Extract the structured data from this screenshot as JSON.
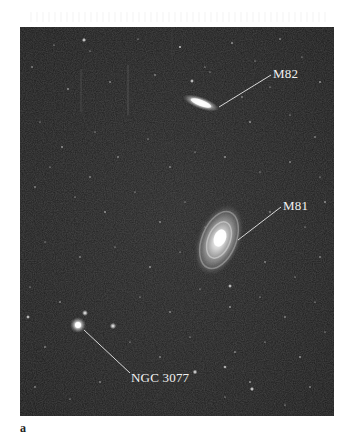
{
  "figure": {
    "panel_letter": "a",
    "background_color": "#1e1e1e",
    "objects": [
      {
        "name": "M82",
        "label": "M82",
        "type": "edge-on galaxy"
      },
      {
        "name": "M81",
        "label": "M81",
        "type": "spiral galaxy"
      },
      {
        "name": "NGC 3077",
        "label": "NGC 3077",
        "type": "galaxy"
      }
    ]
  }
}
